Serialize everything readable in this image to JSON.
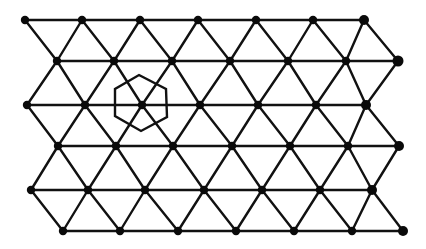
{
  "diagram": {
    "type": "triangular-lattice",
    "background": "#ffffff",
    "line_color": "#111111",
    "node_color": "#0a0a0a",
    "node_radius": 4.2,
    "rows": [
      {
        "y": 20,
        "x": [
          25,
          82,
          140,
          198,
          256,
          313,
          364
        ],
        "end_radius": 5
      },
      {
        "y": 61,
        "x": [
          57,
          114,
          172,
          230,
          288,
          346,
          398
        ],
        "end_radius": 5.5
      },
      {
        "y": 105,
        "x": [
          27,
          85,
          142,
          200,
          258,
          316,
          366
        ],
        "end_radius": 5
      },
      {
        "y": 146,
        "x": [
          58,
          116,
          173,
          232,
          290,
          348,
          399
        ],
        "end_radius": 5
      },
      {
        "y": 190,
        "x": [
          31,
          88,
          145,
          204,
          262,
          320,
          372
        ],
        "end_radius": 5
      },
      {
        "y": 231,
        "x": [
          63,
          120,
          178,
          236,
          294,
          352,
          403
        ],
        "end_radius": 5
      }
    ],
    "highlight_hexagon": {
      "center_node": {
        "row": 2,
        "col": 2
      },
      "vertices": [
        [
          139,
          75
        ],
        [
          166,
          89
        ],
        [
          167,
          117
        ],
        [
          141,
          131
        ],
        [
          115,
          116
        ],
        [
          115,
          89
        ]
      ]
    }
  }
}
